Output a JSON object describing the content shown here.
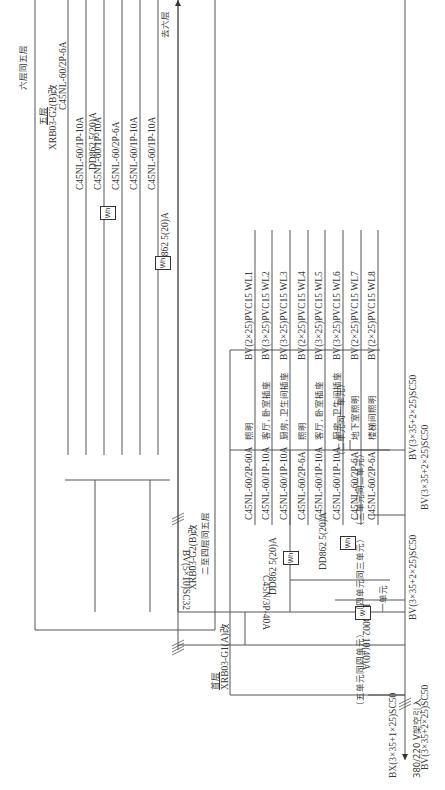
{
  "incoming": {
    "cable": "BX(3×35+1×25)SC50",
    "note": "380/220 V架空引入"
  },
  "riser": {
    "cable": "BV(5×10)SC32",
    "to_sixth": "去六层"
  },
  "first_floor_box": {
    "floor_label": "首层",
    "model": "XRB03-G1(A)改",
    "main_breaker": "C45N/3P-40A",
    "main_meter": "DT8002 10(40)A",
    "main_meter_symbol": "W",
    "unit_label": "一单元",
    "meter1": "DD862 5(20)A",
    "meter2": "DD862 5(20)A",
    "meter_symbol": "Wh",
    "circuits": [
      {
        "breaker": "C45NL-60/2P-60A",
        "use": "照明",
        "cable": "BV(2×25)PVC15 WL1"
      },
      {
        "breaker": "C45NL-60/1P-10A",
        "use": "客厅, 卧室插座",
        "cable": "BV(3×25)PVC15 WL2"
      },
      {
        "breaker": "C45NL-60/1P-10A",
        "use": "厨房, 卫生间插座",
        "cable": "BV(3×25)PVC15 WL3"
      },
      {
        "breaker": "C45NL-60/2P-6A",
        "use": "照明",
        "cable": "BV(2×25)PVC15 WL4"
      },
      {
        "breaker": "C45NL-60/1P-10A",
        "use": "客厅, 卧室插座",
        "cable": "BV(3×25)PVC15 WL5"
      },
      {
        "breaker": "C45NL-60/1P-10A",
        "use": "厨房, 卫生间插座",
        "cable": "BV(3×25)PVC15 WL6"
      },
      {
        "breaker": "C45NL-60/2P-6A",
        "use": "地下室照明",
        "cable": "BV(2×25)PVC15 WL7"
      },
      {
        "breaker": "C45NL-60/2P-6A",
        "use": "楼梯间照明",
        "cable": "BV(2×25)PVC15 WL8"
      }
    ]
  },
  "fifth_floor_box": {
    "floor_label": "五层",
    "model": "XRB03-G2(B)改",
    "same_note": "六层同五层",
    "meter1": "DD862 5(20)A",
    "meter2": "DD862 5(20)A",
    "meter_symbol": "Wh",
    "circuits": [
      {
        "breaker": "C45NL-60/2P-6A",
        "use": "照明",
        "cable": "BV(2×25)PVC15 WL1"
      },
      {
        "breaker": "C45NL-60/1P-10A",
        "use": "客厅, 卧室插座",
        "cable": "BV(3×25)PVC15 WL2"
      },
      {
        "breaker": "C45NL-60/1P-10A",
        "use": "厨房, 卫生间插座",
        "cable": "BV(3×25)PVC15 WL3"
      },
      {
        "breaker": "C45NL-60/2P-6A",
        "use": "照明",
        "cable": "BV(2×25)PVC15 WL4"
      },
      {
        "breaker": "C45NL-60/1P-10A",
        "use": "客厅, 卧室插座",
        "cable": "BV(3×25)PVC15 WL5"
      },
      {
        "breaker": "C45NL-60/1P-10A",
        "use": "厨房, 卫生间插座",
        "cable": "BV(3×25)PVC15 WL6"
      }
    ]
  },
  "middle_box": {
    "model": "XRB03-G2(B)改",
    "note": "二至四层同五层"
  },
  "units": [
    {
      "label": "（二单元同一单元）",
      "cable": "BV(3×35+2×25)SC50"
    },
    {
      "label": "（三单元同二单元）",
      "cable": "BV(3×35+2×25)SC50"
    },
    {
      "label": "（四单元同三单元）",
      "cable": "BV(3×35+2×25)SC50"
    },
    {
      "label": "（五单元同四单元）",
      "cable": "BV(3×35+2×25)SC50"
    }
  ]
}
